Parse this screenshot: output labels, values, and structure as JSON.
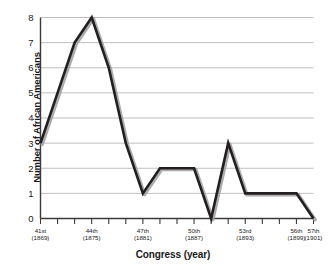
{
  "chart_data": {
    "type": "line",
    "title": "",
    "xlabel": "Congress (year)",
    "ylabel": "Number of African Americans",
    "ylim": [
      0,
      8
    ],
    "yticks": [
      0,
      1,
      2,
      3,
      4,
      5,
      6,
      7,
      8
    ],
    "grid": true,
    "legend": "none",
    "line_color": "#231f20",
    "shadow_color": "#9d9d9d",
    "categories": [
      "41st",
      "42nd",
      "43rd",
      "44th",
      "45th",
      "46th",
      "47th",
      "48th",
      "49th",
      "50th",
      "51st",
      "52nd",
      "53rd",
      "54th",
      "55th",
      "56th",
      "57th"
    ],
    "x_tick_labels": [
      {
        "index": 0,
        "congress": "41st",
        "year": "(1869)"
      },
      {
        "index": 3,
        "congress": "44th",
        "year": "(1875)"
      },
      {
        "index": 6,
        "congress": "47th",
        "year": "(1881)"
      },
      {
        "index": 9,
        "congress": "50th",
        "year": "(1887)"
      },
      {
        "index": 12,
        "congress": "53rd",
        "year": "(1893)"
      },
      {
        "index": 15,
        "congress": "56th",
        "year": "(1899)"
      },
      {
        "index": 16,
        "congress": "57th",
        "year": "(1901)"
      }
    ],
    "values": [
      3,
      5,
      7,
      8,
      6,
      3,
      1,
      2,
      2,
      2,
      0,
      3,
      1,
      1,
      1,
      1,
      0
    ]
  }
}
